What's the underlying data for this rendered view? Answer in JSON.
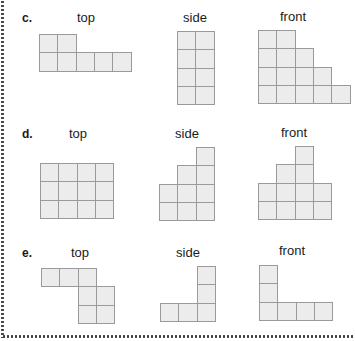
{
  "colors": {
    "cell_fill": "#ececec",
    "cell_border": "#9a9a9a",
    "dotted_border": "#3a3f4a"
  },
  "problems": [
    {
      "letter": "c.",
      "views": [
        {
          "title": "top",
          "cells": [
            [
              0,
              0
            ],
            [
              1,
              0
            ],
            [
              0,
              1
            ],
            [
              1,
              1
            ],
            [
              2,
              1
            ],
            [
              3,
              1
            ],
            [
              4,
              1
            ]
          ]
        },
        {
          "title": "side",
          "cells": [
            [
              0,
              0
            ],
            [
              1,
              0
            ],
            [
              0,
              1
            ],
            [
              1,
              1
            ],
            [
              0,
              2
            ],
            [
              1,
              2
            ],
            [
              0,
              3
            ],
            [
              1,
              3
            ]
          ]
        },
        {
          "title": "front",
          "cells": [
            [
              0,
              0
            ],
            [
              1,
              0
            ],
            [
              0,
              1
            ],
            [
              1,
              1
            ],
            [
              2,
              1
            ],
            [
              0,
              2
            ],
            [
              1,
              2
            ],
            [
              2,
              2
            ],
            [
              3,
              2
            ],
            [
              0,
              3
            ],
            [
              1,
              3
            ],
            [
              2,
              3
            ],
            [
              3,
              3
            ],
            [
              4,
              3
            ]
          ]
        }
      ]
    },
    {
      "letter": "d.",
      "views": [
        {
          "title": "top",
          "cells": [
            [
              0,
              0
            ],
            [
              1,
              0
            ],
            [
              2,
              0
            ],
            [
              3,
              0
            ],
            [
              0,
              1
            ],
            [
              1,
              1
            ],
            [
              2,
              1
            ],
            [
              3,
              1
            ],
            [
              0,
              2
            ],
            [
              1,
              2
            ],
            [
              2,
              2
            ],
            [
              3,
              2
            ]
          ]
        },
        {
          "title": "side",
          "cells": [
            [
              2,
              0
            ],
            [
              1,
              1
            ],
            [
              2,
              1
            ],
            [
              0,
              2
            ],
            [
              1,
              2
            ],
            [
              2,
              2
            ],
            [
              0,
              3
            ],
            [
              1,
              3
            ],
            [
              2,
              3
            ]
          ]
        },
        {
          "title": "front",
          "cells": [
            [
              2,
              0
            ],
            [
              1,
              1
            ],
            [
              2,
              1
            ],
            [
              0,
              2
            ],
            [
              1,
              2
            ],
            [
              2,
              2
            ],
            [
              3,
              2
            ],
            [
              0,
              3
            ],
            [
              1,
              3
            ],
            [
              2,
              3
            ],
            [
              3,
              3
            ]
          ]
        }
      ]
    },
    {
      "letter": "e.",
      "views": [
        {
          "title": "top",
          "cells": [
            [
              0,
              0
            ],
            [
              1,
              0
            ],
            [
              2,
              0
            ],
            [
              2,
              1
            ],
            [
              3,
              1
            ],
            [
              2,
              2
            ],
            [
              3,
              2
            ]
          ]
        },
        {
          "title": "side",
          "cells": [
            [
              2,
              0
            ],
            [
              2,
              1
            ],
            [
              0,
              2
            ],
            [
              1,
              2
            ],
            [
              2,
              2
            ]
          ]
        },
        {
          "title": "front",
          "cells": [
            [
              0,
              0
            ],
            [
              0,
              1
            ],
            [
              0,
              2
            ],
            [
              1,
              2
            ],
            [
              2,
              2
            ],
            [
              3,
              2
            ]
          ]
        }
      ]
    }
  ]
}
